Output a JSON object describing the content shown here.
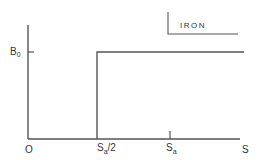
{
  "diagram": {
    "legend": {
      "label": "IRON"
    },
    "y_axis": {
      "tick_label": "B",
      "tick_sub": "0"
    },
    "x_axis": {
      "origin_label": "O",
      "ticks": [
        {
          "main": "S",
          "sub": "a",
          "suffix": "/2"
        },
        {
          "main": "S",
          "sub": "a",
          "suffix": ""
        }
      ],
      "axis_label": "S"
    },
    "curve": {
      "description": "step function: 0 for S < Sa/2, B0 for S >= Sa/2",
      "step_at": "Sa/2",
      "level": "B0"
    },
    "colors": {
      "line": "#555555",
      "text": "#333333"
    }
  }
}
